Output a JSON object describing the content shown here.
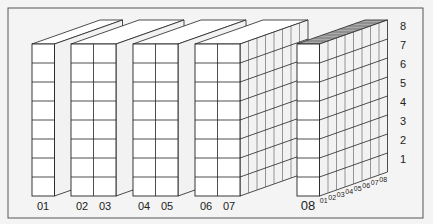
{
  "diagram": {
    "title": "",
    "colors": {
      "background": "#f4f4f4",
      "frame": "#555555",
      "line": "#222222",
      "face_front": "#ffffff",
      "face_side": "#f2f2f2",
      "face_top": "#ffffff",
      "top_shaded": "#aaaaaa"
    },
    "column_labels": [
      "01",
      "02",
      "03",
      "04",
      "05",
      "06",
      "07",
      "08"
    ],
    "row_labels": [
      "1",
      "2",
      "3",
      "4",
      "5",
      "6",
      "7",
      "8"
    ],
    "depth_labels": [
      "01",
      "02",
      "03",
      "04",
      "05",
      "06",
      "07",
      "08"
    ],
    "blocks": [
      {
        "name": "block-01",
        "columns": [
          "01"
        ]
      },
      {
        "name": "block-02-03",
        "columns": [
          "02",
          "03"
        ]
      },
      {
        "name": "block-04-05",
        "columns": [
          "04",
          "05"
        ]
      },
      {
        "name": "block-06-07",
        "columns": [
          "06",
          "07"
        ],
        "side_grid": true
      },
      {
        "name": "block-08",
        "columns": [
          "08"
        ],
        "side_grid": true,
        "depth_labeled": true
      }
    ],
    "rows": 8,
    "depth_cells": 8
  }
}
